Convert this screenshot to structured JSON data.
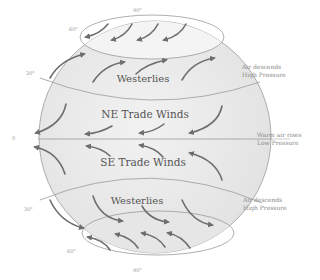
{
  "diagram": {
    "bands": [
      {
        "id": "north-westerlies",
        "label": "Westerlies"
      },
      {
        "id": "ne-trade",
        "label": "NE Trade Winds"
      },
      {
        "id": "se-trade",
        "label": "SE Trade Winds"
      },
      {
        "id": "south-westerlies",
        "label": "Westerlies"
      }
    ],
    "side_labels": {
      "north_30": {
        "line1": "Air descends",
        "line2": "High Pressure"
      },
      "equator": {
        "line1": "Warm air rises",
        "line2": "Low Pressure"
      },
      "south_30": {
        "line1": "Air descends",
        "line2": "High Pressure"
      }
    },
    "latitudes": {
      "north_90": "90°",
      "north_60": "60°",
      "north_30": "30°",
      "equator": "0",
      "south_30": "30°",
      "south_60": "60°",
      "south_90": "90°"
    },
    "colors": {
      "globe_fill": "#ececec",
      "globe_stroke": "#9a9a9a",
      "arrow": "#6e6e6e",
      "text": "#555555"
    }
  }
}
